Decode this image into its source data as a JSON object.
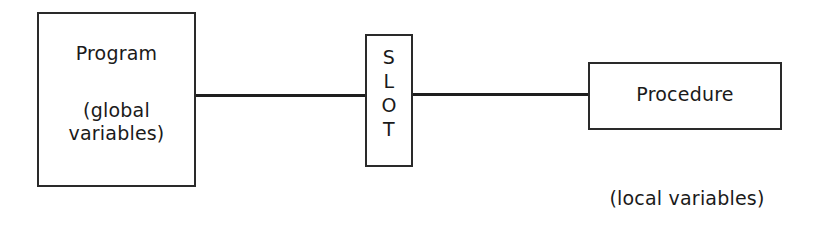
{
  "diagram": {
    "program": {
      "title": "Program",
      "subtitle_line1": "(global",
      "subtitle_line2": "variables)"
    },
    "slot": {
      "label": "SLOT",
      "letters": [
        "S",
        "L",
        "O",
        "T"
      ]
    },
    "procedure": {
      "title": "Procedure",
      "annotation": "(local variables)"
    },
    "connections": [
      {
        "from": "Program",
        "to": "SLOT"
      },
      {
        "from": "SLOT",
        "to": "Procedure"
      }
    ],
    "colors": {
      "stroke": "#2a2a2a",
      "text": "#1a1a1a",
      "background": "#ffffff"
    }
  }
}
